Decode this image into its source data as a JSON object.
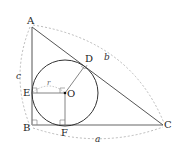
{
  "diagram": {
    "type": "incircle-right-triangle",
    "points": {
      "A": {
        "label": "A",
        "x": 32,
        "y": 27
      },
      "B": {
        "label": "B",
        "x": 32,
        "y": 125
      },
      "C": {
        "label": "C",
        "x": 163,
        "y": 125
      },
      "D": {
        "label": "D",
        "x": 84,
        "y": 63
      },
      "E": {
        "label": "E",
        "x": 32,
        "y": 93
      },
      "F": {
        "label": "F",
        "x": 65,
        "y": 125
      },
      "O": {
        "label": "O",
        "x": 65,
        "y": 93
      }
    },
    "sides": {
      "a": "a",
      "b": "b",
      "c": "c"
    },
    "radius_label": "r",
    "colors": {
      "line": "#555555",
      "circle": "#333333",
      "dashed": "#aaaaaa"
    }
  }
}
